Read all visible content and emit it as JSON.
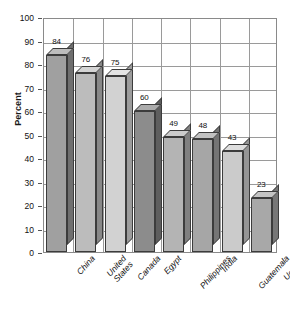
{
  "chart_data": {
    "type": "bar",
    "title": "",
    "xlabel": "",
    "ylabel": "Percent",
    "ylim": [
      0,
      100
    ],
    "ytick_step": 10,
    "grid": true,
    "legend": "none",
    "style": "3d-bars-grayscale",
    "categories": [
      "China",
      "United States",
      "Canada",
      "Egypt",
      "Philippines",
      "India",
      "Guatemala",
      "Uganda"
    ],
    "values": [
      84,
      76,
      75,
      60,
      49,
      48,
      43,
      23
    ],
    "yticks": [
      "100",
      "90",
      "80",
      "70",
      "60",
      "50",
      "40",
      "30",
      "20",
      "10",
      "0"
    ],
    "bars": [
      {
        "category": "China",
        "label_line1": "China",
        "label_line2": "",
        "value": 84,
        "value_label": "84",
        "fill": "#a0a0a0",
        "top": "#bdbdbd",
        "side": "#6f6f6f"
      },
      {
        "category": "United States",
        "label_line1": "United",
        "label_line2": "States",
        "value": 76,
        "value_label": "76",
        "fill": "#bcbcbc",
        "top": "#d4d4d4",
        "side": "#888888"
      },
      {
        "category": "Canada",
        "label_line1": "Canada",
        "label_line2": "",
        "value": 75,
        "value_label": "75",
        "fill": "#d2d2d2",
        "top": "#e4e4e4",
        "side": "#9c9c9c"
      },
      {
        "category": "Egypt",
        "label_line1": "Egypt",
        "label_line2": "",
        "value": 60,
        "value_label": "60",
        "fill": "#8c8c8c",
        "top": "#ababab",
        "side": "#5e5e5e"
      },
      {
        "category": "Philippines",
        "label_line1": "Philippines",
        "label_line2": "",
        "value": 49,
        "value_label": "49",
        "fill": "#b4b4b4",
        "top": "#cccccc",
        "side": "#808080"
      },
      {
        "category": "India",
        "label_line1": "India",
        "label_line2": "",
        "value": 48,
        "value_label": "48",
        "fill": "#a6a6a6",
        "top": "#c2c2c2",
        "side": "#757575"
      },
      {
        "category": "Guatemala",
        "label_line1": "Guatemala",
        "label_line2": "",
        "value": 43,
        "value_label": "43",
        "fill": "#cbcbcb",
        "top": "#dedede",
        "side": "#959595"
      },
      {
        "category": "Uganda",
        "label_line1": "Uganda",
        "label_line2": "",
        "value": 23,
        "value_label": "23",
        "fill": "#a8a8a8",
        "top": "#c4c4c4",
        "side": "#777777"
      }
    ],
    "colors": {
      "axis": "#8a8a8a",
      "grid": "#9a9a9a",
      "text": "#111111",
      "bar_outline": "#3c3c3c",
      "background": "#ffffff"
    }
  }
}
